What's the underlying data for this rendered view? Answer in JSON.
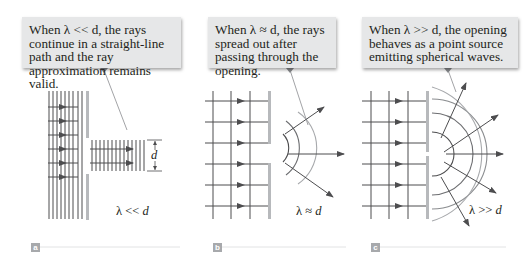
{
  "panels": [
    {
      "id": "a",
      "label": "a",
      "callout": "When λ << d, the rays continue in a straight-line path and the ray approximation remains valid.",
      "caption_lambda": "λ << ",
      "caption_d": "d",
      "dimension_label": "d"
    },
    {
      "id": "b",
      "label": "b",
      "callout": "When λ ≈ d, the rays spread out after passing through the opening.",
      "caption_lambda": "λ ≈ ",
      "caption_d": "d"
    },
    {
      "id": "c",
      "label": "c",
      "callout": "When λ >> d, the opening behaves as a point source emitting spherical waves.",
      "caption_lambda": "λ >> ",
      "caption_d": "d"
    }
  ],
  "colors": {
    "callout_bg": "#e6e7e8",
    "line": "#4d4d4f",
    "barrier": "#b7b9bc",
    "wavefront": "#a7a9ac",
    "label_bg": "#a7a9ac"
  }
}
